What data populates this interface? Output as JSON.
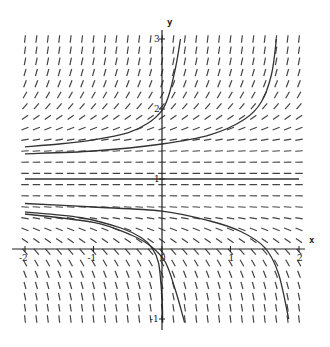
{
  "chart_data": {
    "type": "slope_field",
    "title": "",
    "xlabel": "x",
    "ylabel": "y",
    "equation": "dy/dx = (y - 1)^3",
    "equilibrium": 1,
    "xlim": [
      -2,
      2
    ],
    "ylim": [
      -1,
      3
    ],
    "x_ticks": [
      {
        "value": -2,
        "label": "-2"
      },
      {
        "value": -1,
        "label": "-1"
      },
      {
        "value": 0,
        "label": "0"
      },
      {
        "value": 1,
        "label": "1"
      },
      {
        "value": 2,
        "label": "2"
      }
    ],
    "y_ticks": [
      {
        "value": -1,
        "label": "-1"
      },
      {
        "value": 1,
        "label": "1"
      },
      {
        "value": 2,
        "label": "2"
      },
      {
        "value": 3,
        "label": "3"
      }
    ],
    "grid": false,
    "field_grid": {
      "columns": 25,
      "rows": 26
    },
    "solution_curves": [
      {
        "name": "curve-a",
        "points": [
          [
            -2,
            1.46
          ],
          [
            -1.5,
            1.5
          ],
          [
            -1,
            1.56
          ],
          [
            -0.5,
            1.66
          ],
          [
            -0.2,
            1.8
          ],
          [
            0,
            1.98
          ],
          [
            0.1,
            2.2
          ],
          [
            0.2,
            2.6
          ],
          [
            0.27,
            3.0
          ]
        ]
      },
      {
        "name": "curve-b",
        "points": [
          [
            -2,
            1.36
          ],
          [
            -1,
            1.4
          ],
          [
            0,
            1.5
          ],
          [
            0.7,
            1.63
          ],
          [
            1.2,
            1.85
          ],
          [
            1.45,
            2.1
          ],
          [
            1.6,
            2.5
          ],
          [
            1.67,
            3.0
          ]
        ]
      },
      {
        "name": "curve-c",
        "points": [
          [
            -2,
            0.65
          ],
          [
            -1,
            0.6
          ],
          [
            0,
            0.54
          ],
          [
            0.7,
            0.4
          ],
          [
            1.15,
            0.25
          ],
          [
            1.5,
            0.02
          ],
          [
            1.7,
            -0.35
          ],
          [
            1.85,
            -1.0
          ]
        ]
      },
      {
        "name": "curve-d",
        "points": [
          [
            -2,
            0.53
          ],
          [
            -1.2,
            0.45
          ],
          [
            -0.6,
            0.3
          ],
          [
            -0.3,
            0.16
          ],
          [
            -0.15,
            0.02
          ],
          [
            -0.05,
            -0.2
          ],
          [
            0,
            -0.7
          ],
          [
            0.01,
            -1.05
          ]
        ]
      },
      {
        "name": "curve-e",
        "points": [
          [
            -2,
            0.5
          ],
          [
            -1,
            0.38
          ],
          [
            -0.45,
            0.2
          ],
          [
            -0.15,
            0.03
          ],
          [
            0.05,
            -0.19
          ],
          [
            0.2,
            -0.6
          ],
          [
            0.33,
            -1.05
          ]
        ]
      }
    ]
  },
  "colors": {
    "field": "#444444",
    "curve": "#333333",
    "axis": "#222222"
  }
}
